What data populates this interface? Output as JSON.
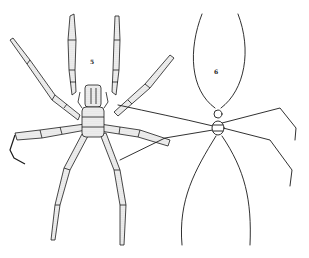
{
  "figure": {
    "figures": [
      {
        "number": "5",
        "label_x": 92,
        "label_y": 62,
        "style": "robust segmented legs with long proboscis"
      },
      {
        "number": "6",
        "label_x": 216,
        "label_y": 72,
        "style": "very slender thread-like legs with small body"
      }
    ],
    "ink_color": "#1a1a1a",
    "background": "#ffffff"
  }
}
